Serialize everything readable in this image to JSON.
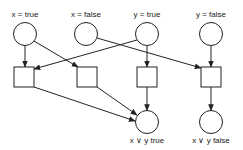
{
  "diagram": {
    "type": "petri-net",
    "colors": {
      "stroke": "#222222",
      "background": "#ffffff",
      "text": "#222222"
    },
    "places": [
      {
        "id": "p_x_true",
        "label": "x = true",
        "cx": 25,
        "cy": 34,
        "r": 11.5
      },
      {
        "id": "p_x_false",
        "label": "x = false",
        "cx": 86,
        "cy": 34,
        "r": 11.5
      },
      {
        "id": "p_y_true",
        "label": "y = true",
        "cx": 147,
        "cy": 34,
        "r": 11.5
      },
      {
        "id": "p_y_false",
        "label": "y = false",
        "cx": 211,
        "cy": 34,
        "r": 11.5
      },
      {
        "id": "p_xy_true",
        "label": "x ∨ y true",
        "cx": 147,
        "cy": 122,
        "r": 11.5
      },
      {
        "id": "p_xy_false",
        "label": "x ∨ y false",
        "cx": 211,
        "cy": 122,
        "r": 11.5
      }
    ],
    "transitions": [
      {
        "id": "t1",
        "x": 14,
        "y": 67,
        "w": 20,
        "h": 20
      },
      {
        "id": "t2",
        "x": 77,
        "y": 67,
        "w": 20,
        "h": 20
      },
      {
        "id": "t3",
        "x": 137,
        "y": 67,
        "w": 20,
        "h": 20
      },
      {
        "id": "t4",
        "x": 201,
        "y": 67,
        "w": 20,
        "h": 20
      }
    ],
    "arcs": [
      {
        "from": "p_x_true",
        "to": "t1",
        "x1": 25,
        "y1": 45.5,
        "x2": 25,
        "y2": 67
      },
      {
        "from": "p_x_true",
        "to": "t2",
        "x1": 34,
        "y1": 41,
        "x2": 78,
        "y2": 67
      },
      {
        "from": "p_y_true",
        "to": "t1",
        "x1": 137,
        "y1": 40,
        "x2": 34,
        "y2": 69
      },
      {
        "from": "p_y_true",
        "to": "t3",
        "x1": 147,
        "y1": 45.5,
        "x2": 147,
        "y2": 67
      },
      {
        "from": "p_x_false",
        "to": "t4",
        "x1": 97,
        "y1": 38,
        "x2": 201,
        "y2": 68
      },
      {
        "from": "p_y_false",
        "to": "t4",
        "x1": 211,
        "y1": 45.5,
        "x2": 211,
        "y2": 67
      },
      {
        "from": "t1",
        "to": "p_xy_true",
        "x1": 34,
        "y1": 87,
        "x2": 135,
        "y2": 121
      },
      {
        "from": "t2",
        "to": "p_xy_true",
        "x1": 97,
        "y1": 87,
        "x2": 137,
        "y2": 115
      },
      {
        "from": "t3",
        "to": "p_xy_true",
        "x1": 147,
        "y1": 87,
        "x2": 147,
        "y2": 110.5
      },
      {
        "from": "t4",
        "to": "p_xy_false",
        "x1": 211,
        "y1": 87,
        "x2": 211,
        "y2": 110.5
      }
    ],
    "labels": {
      "x_true": "x = true",
      "x_false": "x = false",
      "y_true": "y = true",
      "y_false": "y = false",
      "xy_true": "x ∨ y true",
      "xy_false": "x ∨ y false"
    }
  }
}
